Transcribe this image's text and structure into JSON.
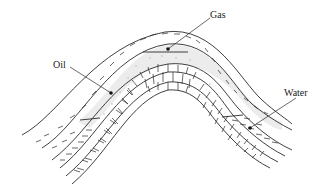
{
  "diagram": {
    "type": "anticline oil trap cross-section",
    "labels": {
      "gas": "Gas",
      "oil": "Oil",
      "water": "Water"
    },
    "colors": {
      "line": "#2a2a2a",
      "reservoir_fill": "#ececec",
      "background": "#ffffff"
    }
  }
}
